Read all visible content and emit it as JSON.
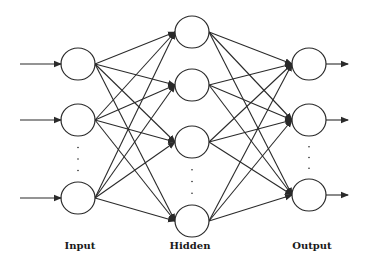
{
  "colors": {
    "stroke": "#2a2a2a",
    "background": "#ffffff"
  },
  "layers": [
    {
      "name": "input",
      "label": "Input",
      "x": 78,
      "label_x": 80,
      "nodes": [
        64,
        120,
        198
      ],
      "ellipsis_between": [
        1,
        2
      ]
    },
    {
      "name": "hidden",
      "label": "Hidden",
      "x": 192,
      "label_x": 190,
      "nodes": [
        32,
        85,
        142,
        221
      ],
      "ellipsis_between": [
        2,
        3
      ]
    },
    {
      "name": "output",
      "label": "Output",
      "x": 309,
      "label_x": 312,
      "nodes": [
        64,
        120,
        195
      ],
      "ellipsis_between": [
        1,
        2
      ]
    }
  ],
  "node": {
    "rx": 17,
    "ry": 16
  },
  "input_arrows": {
    "from_x": 20
  },
  "output_arrows": {
    "to_x": 348
  },
  "labels": {
    "input": "Input",
    "hidden": "Hidden",
    "output": "Output"
  },
  "label_y": 240
}
